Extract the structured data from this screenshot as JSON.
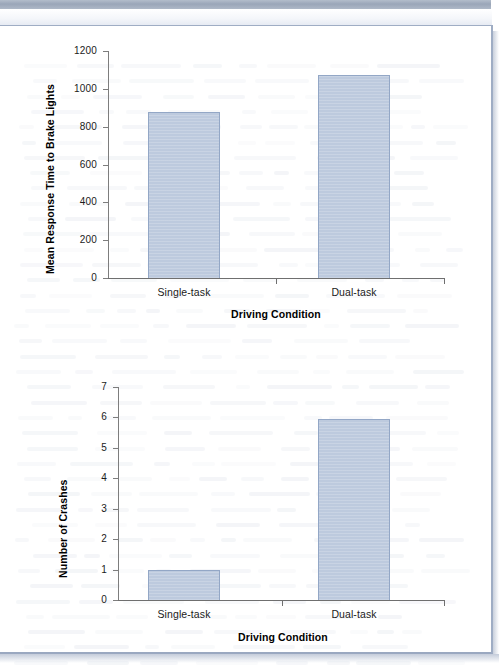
{
  "page": {
    "kind": "scanned-textbook-figure",
    "bar_fill_color": "#bdcade",
    "bar_border_color": "#93a7c6",
    "axis_color": "#6f6f6f",
    "page_border_color": "#9fadc4",
    "scanner_band_color": "#9aa6b8"
  },
  "chart_data": [
    {
      "id": "response-time",
      "type": "bar",
      "title": "",
      "categories": [
        "Single-task",
        "Dual-task"
      ],
      "values": [
        880,
        1075
      ],
      "xlabel": "Driving Condition",
      "ylabel": "Mean Response Time to Brake Lights",
      "ylim": [
        0,
        1200
      ],
      "yticks": [
        0,
        200,
        400,
        600,
        800,
        1000,
        1200
      ],
      "ytick_labels": [
        "0",
        "200",
        "400",
        "600",
        "800",
        "1000",
        "1200"
      ],
      "grid": false,
      "legend": "none"
    },
    {
      "id": "crashes",
      "type": "bar",
      "title": "",
      "categories": [
        "Single-task",
        "Dual-task"
      ],
      "values": [
        1,
        5.95
      ],
      "xlabel": "Driving Condition",
      "ylabel": "Number of Crashes",
      "ylim": [
        0,
        7
      ],
      "yticks": [
        0,
        1,
        2,
        3,
        4,
        5,
        6,
        7
      ],
      "ytick_labels": [
        "0",
        "1",
        "2",
        "3",
        "4",
        "5",
        "6",
        "7"
      ],
      "grid": false,
      "legend": "none"
    }
  ]
}
